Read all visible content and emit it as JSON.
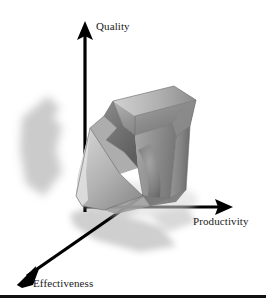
{
  "figure": {
    "type": "3d-axes-diagram",
    "background_color": "#ffffff",
    "width": 266,
    "height": 306
  },
  "axes": [
    {
      "id": "quality",
      "label": "Quality",
      "direction": "up",
      "color": "#000000",
      "label_position": {
        "x": 96,
        "y": 20
      }
    },
    {
      "id": "productivity",
      "label": "Productivity",
      "direction": "right",
      "color": "#000000",
      "label_position": {
        "x": 193,
        "y": 215
      }
    },
    {
      "id": "effectiveness",
      "label": "Effectiveness",
      "direction": "down-left",
      "color": "#000000",
      "label_position": {
        "x": 33,
        "y": 277
      }
    }
  ],
  "object": {
    "name": "3d-chevron-arrow",
    "description": "shaded three-dimensional arrow / chevron block",
    "face_colors": {
      "top": "#8d8d8d",
      "top_highlight": "#b9b9b9",
      "front_left": "#c9c9c9",
      "front_right": "#9a9a9a",
      "side_right": "#7e7e7e",
      "inner_notch": "#6f6f6f",
      "edge": "#5a5a5a"
    }
  },
  "shadows": {
    "color": "#c6c6c6",
    "left_shadow": "cast shadow at left of vertical axis",
    "floor_shadow": "cast shadow along the lower plane"
  },
  "rule": {
    "name": "bottom-rule",
    "color": "#111111"
  }
}
